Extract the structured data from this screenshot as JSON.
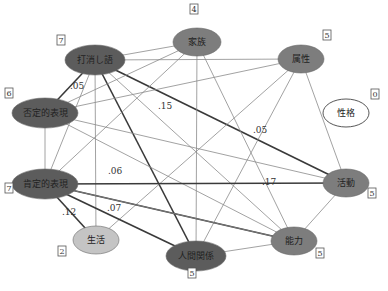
{
  "diagram": {
    "type": "co-occurrence network",
    "colors": {
      "dark": "#5c5c5c",
      "medium": "#7d7d7d",
      "light": "#c4c4c4",
      "white": "#ffffff",
      "edge_thin": "#8a8a8a",
      "edge_thick": "#3a3a3a"
    },
    "nodes": [
      {
        "id": "uchikeshi",
        "label": "打消し語",
        "degree": "7",
        "x": 95,
        "y": 60,
        "rx": 30,
        "ry": 15,
        "fill": "dark",
        "box_x": 61,
        "box_y": 43
      },
      {
        "id": "kazoku",
        "label": "家族",
        "degree": "4",
        "x": 197,
        "y": 42,
        "rx": 24,
        "ry": 14,
        "fill": "medium",
        "box_x": 194,
        "box_y": 12
      },
      {
        "id": "zokusei",
        "label": "属性",
        "degree": "5",
        "x": 301,
        "y": 59,
        "rx": 23,
        "ry": 14,
        "fill": "medium",
        "box_x": 327,
        "box_y": 38
      },
      {
        "id": "seikaku",
        "label": "性格",
        "degree": "0",
        "x": 346,
        "y": 113,
        "rx": 23,
        "ry": 14,
        "fill": "white",
        "box_x": 375,
        "box_y": 97
      },
      {
        "id": "hitei",
        "label": "否定的表現",
        "degree": "6",
        "x": 45,
        "y": 113,
        "rx": 33,
        "ry": 15,
        "fill": "dark",
        "box_x": 9,
        "box_y": 96
      },
      {
        "id": "koutei",
        "label": "肯定的表現",
        "degree": "7",
        "x": 45,
        "y": 184,
        "rx": 33,
        "ry": 15,
        "fill": "dark",
        "box_x": 9,
        "box_y": 191
      },
      {
        "id": "katsudou",
        "label": "活動",
        "degree": "5",
        "x": 346,
        "y": 183,
        "rx": 23,
        "ry": 14,
        "fill": "medium",
        "box_x": 372,
        "box_y": 196
      },
      {
        "id": "seikatsu",
        "label": "生活",
        "degree": "2",
        "x": 96,
        "y": 240,
        "rx": 23,
        "ry": 14,
        "fill": "light",
        "box_x": 62,
        "box_y": 254
      },
      {
        "id": "ningen",
        "label": "人間関係",
        "degree": "5",
        "x": 196,
        "y": 256,
        "rx": 30,
        "ry": 15,
        "fill": "dark",
        "box_x": 192,
        "box_y": 276
      },
      {
        "id": "nouryoku",
        "label": "能力",
        "degree": "5",
        "x": 294,
        "y": 241,
        "rx": 23,
        "ry": 14,
        "fill": "medium",
        "box_x": 320,
        "box_y": 256
      }
    ],
    "edges": [
      {
        "from": "uchikeshi",
        "to": "kazoku",
        "weight": "thin"
      },
      {
        "from": "uchikeshi",
        "to": "zokusei",
        "weight": "thin"
      },
      {
        "from": "uchikeshi",
        "to": "hitei",
        "weight": "thick",
        "label": ".05",
        "lx": 70,
        "ly": 89
      },
      {
        "from": "uchikeshi",
        "to": "ningen",
        "weight": "thick",
        "label": ".15",
        "lx": 158,
        "ly": 109
      },
      {
        "from": "uchikeshi",
        "to": "katsudou",
        "weight": "thick",
        "label": ".05",
        "lx": 253,
        "ly": 133
      },
      {
        "from": "uchikeshi",
        "to": "nouryoku",
        "weight": "thin"
      },
      {
        "from": "uchikeshi",
        "to": "koutei",
        "weight": "thin"
      },
      {
        "from": "uchikeshi",
        "to": "seikatsu",
        "weight": "thin"
      },
      {
        "from": "kazoku",
        "to": "hitei",
        "weight": "thin"
      },
      {
        "from": "kazoku",
        "to": "koutei",
        "weight": "thin"
      },
      {
        "from": "kazoku",
        "to": "ningen",
        "weight": "thin"
      },
      {
        "from": "kazoku",
        "to": "nouryoku",
        "weight": "thin"
      },
      {
        "from": "zokusei",
        "to": "hitei",
        "weight": "thin"
      },
      {
        "from": "zokusei",
        "to": "ningen",
        "weight": "thin"
      },
      {
        "from": "zokusei",
        "to": "katsudou",
        "weight": "thin"
      },
      {
        "from": "zokusei",
        "to": "seikatsu",
        "weight": "thin"
      },
      {
        "from": "hitei",
        "to": "koutei",
        "weight": "thin"
      },
      {
        "from": "hitei",
        "to": "katsudou",
        "weight": "thin"
      },
      {
        "from": "hitei",
        "to": "nouryoku",
        "weight": "thin"
      },
      {
        "from": "koutei",
        "to": "katsudou",
        "weight": "thick",
        "label": ".17",
        "lx": 262,
        "ly": 185
      },
      {
        "from": "koutei",
        "to": "nouryoku",
        "weight": "thick",
        "label": ".06",
        "lx": 108,
        "ly": 174
      },
      {
        "from": "koutei",
        "to": "ningen",
        "weight": "thick",
        "label": ".07",
        "lx": 107,
        "ly": 211
      },
      {
        "from": "koutei",
        "to": "seikatsu",
        "weight": "thick",
        "label": ".12",
        "lx": 62,
        "ly": 215
      },
      {
        "from": "koutei",
        "to": "nouryoku",
        "weight": "thin"
      },
      {
        "from": "katsudou",
        "to": "nouryoku",
        "weight": "thin"
      },
      {
        "from": "ningen",
        "to": "nouryoku",
        "weight": "thin"
      }
    ]
  }
}
